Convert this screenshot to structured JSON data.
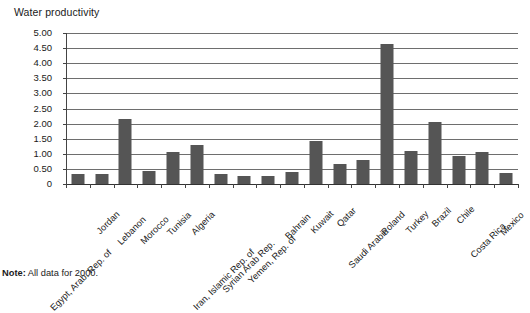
{
  "chart_data": {
    "type": "bar",
    "title": "Water productivity",
    "xlabel": "",
    "ylabel": "",
    "ylim": [
      0,
      5.0
    ],
    "ytick_labels": [
      "5.00",
      "4.50",
      "4.00",
      "3.50",
      "3.00",
      "2.50",
      "2.00",
      "1.50",
      "1.00",
      "0.50",
      "0"
    ],
    "ytick_values": [
      5.0,
      4.5,
      4.0,
      3.5,
      3.0,
      2.5,
      2.0,
      1.5,
      1.0,
      0.5,
      0
    ],
    "grid": true,
    "legend": null,
    "categories": [
      "Egypt, Arab. Rep. of",
      "Jordan",
      "Lebanon",
      "Morocco",
      "Tunisia",
      "Algeria",
      "Iran, Islamic Rep. of",
      "Syrian Arab Rep.",
      "Yemen, Rep. of",
      "Bahrain",
      "Kuwait",
      "Qatar",
      "Saudi Arabia",
      "Poland",
      "Turkey",
      "Brazil",
      "Chile",
      "Costa Rica",
      "Mexico"
    ],
    "values": [
      0.33,
      0.32,
      2.15,
      0.42,
      1.05,
      1.28,
      0.32,
      0.28,
      0.27,
      0.4,
      1.42,
      0.67,
      0.78,
      4.65,
      1.1,
      2.05,
      0.92,
      1.05,
      0.38
    ],
    "annotations": [
      "Note: All data for 2000."
    ]
  },
  "footnote": {
    "label": "Note:",
    "text": " All data for 2000."
  },
  "colors": {
    "bar": "#555555",
    "gridline": "#6e6e6e",
    "axis": "#444444",
    "text": "#1a1a1a",
    "background": "#ffffff"
  }
}
